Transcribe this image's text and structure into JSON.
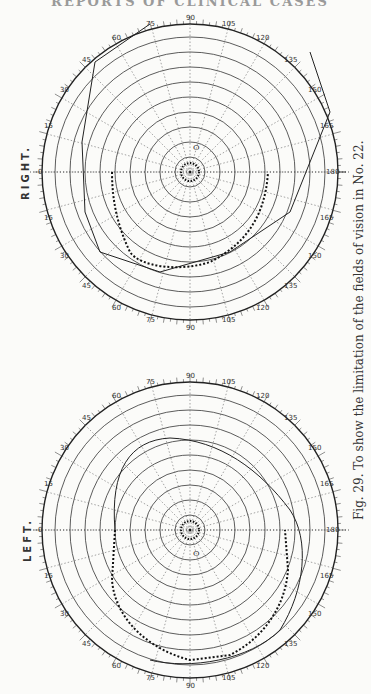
{
  "page": {
    "header": "REPORTS OF CLINICAL CASES",
    "caption": "Fig. 29.  To show the limitation of the fields of vision in No. 22."
  },
  "charts": {
    "right": {
      "label": "RIGHT."
    },
    "left": {
      "label": "LEFT."
    }
  },
  "chart_data": [
    {
      "type": "scatter",
      "title": "RIGHT.",
      "subtype": "polar perimetry chart (visual field)",
      "radial_rings_deg": [
        10,
        20,
        30,
        40,
        50,
        60,
        70,
        80,
        90
      ],
      "radial_axis_labels": [
        "10",
        "20",
        "30",
        "40",
        "50",
        "60",
        "70",
        "80",
        "90"
      ],
      "meridian_labels_deg": [
        0,
        15,
        30,
        45,
        60,
        75,
        90,
        105,
        120,
        135,
        150,
        165,
        180,
        165,
        150,
        135,
        120,
        105,
        90,
        75,
        60,
        45,
        30,
        15
      ],
      "meridian_spacing_deg": 15,
      "grid": true,
      "series": [
        {
          "name": "field limit (dotted)",
          "style": "dotted",
          "description": "constricted field, approx 50° along horizontal meridian, bulging to ~55° inferiorly on temporal side"
        },
        {
          "name": "normal field outline (solid)",
          "style": "solid",
          "description": "normal field boundary reaching ~90° at periphery"
        },
        {
          "name": "central blind area (dotted)",
          "style": "dotted",
          "description": "small central ring ~8° around fixation"
        }
      ],
      "annotations": [
        "O (blind spot marker near 15°)"
      ]
    },
    {
      "type": "scatter",
      "title": "LEFT.",
      "subtype": "polar perimetry chart (visual field)",
      "radial_rings_deg": [
        10,
        20,
        30,
        40,
        50,
        60,
        70,
        80,
        90
      ],
      "radial_axis_labels": [
        "10",
        "20",
        "30",
        "40",
        "50",
        "60",
        "70",
        "80",
        "90"
      ],
      "meridian_labels_deg": [
        0,
        15,
        30,
        45,
        60,
        75,
        90,
        105,
        120,
        135,
        150,
        165,
        180,
        165,
        150,
        135,
        120,
        105,
        90,
        75,
        60,
        45,
        30,
        15
      ],
      "meridian_spacing_deg": 15,
      "grid": true,
      "series": [
        {
          "name": "field limit (dotted)",
          "style": "dotted",
          "description": "constricted field ~50–55° horizontally, extending to ~90° inferiorly and ~70° toward 135°"
        },
        {
          "name": "normal field outline (solid)",
          "style": "solid",
          "description": "normal field boundary"
        },
        {
          "name": "central blind area (dotted)",
          "style": "dotted",
          "description": "small central ring ~8° around fixation"
        }
      ],
      "annotations": [
        "O (blind spot marker near 15°)"
      ]
    }
  ]
}
